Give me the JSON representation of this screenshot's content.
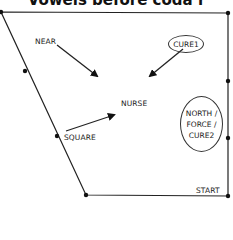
{
  "title": "Vowels before coda r",
  "labels": {
    "near": "NEAR",
    "cure1": "CURE1",
    "nurse": "NURSE",
    "square": "SQUARE",
    "north_force_cure2": [
      "NORTH /",
      "FORCE /",
      "CURE2"
    ],
    "start": "START"
  },
  "colors": {
    "line": "#222222",
    "background": "#ffffff"
  }
}
